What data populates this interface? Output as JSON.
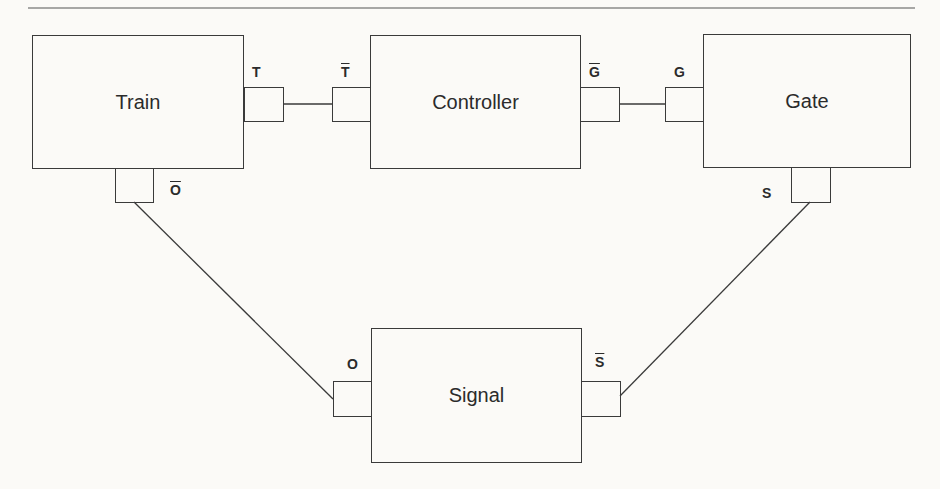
{
  "diagram": {
    "components": [
      {
        "id": "train",
        "label": "Train"
      },
      {
        "id": "controller",
        "label": "Controller"
      },
      {
        "id": "gate",
        "label": "Gate"
      },
      {
        "id": "signal",
        "label": "Signal"
      }
    ],
    "ports": [
      {
        "id": "train-t",
        "label": "T",
        "overbar": false,
        "component": "Train"
      },
      {
        "id": "train-o",
        "label": "O",
        "overbar": true,
        "component": "Train"
      },
      {
        "id": "controller-t",
        "label": "T",
        "overbar": true,
        "component": "Controller"
      },
      {
        "id": "controller-g",
        "label": "G",
        "overbar": true,
        "component": "Controller"
      },
      {
        "id": "gate-g",
        "label": "G",
        "overbar": false,
        "component": "Gate"
      },
      {
        "id": "gate-s",
        "label": "S",
        "overbar": false,
        "component": "Gate"
      },
      {
        "id": "signal-o",
        "label": "O",
        "overbar": false,
        "component": "Signal"
      },
      {
        "id": "signal-s",
        "label": "S",
        "overbar": true,
        "component": "Signal"
      }
    ],
    "connections": [
      {
        "from": "Train.T",
        "to": "Controller.T̄"
      },
      {
        "from": "Controller.Ḡ",
        "to": "Gate.G"
      },
      {
        "from": "Train.Ō",
        "to": "Signal.O"
      },
      {
        "from": "Gate.S",
        "to": "Signal.S̄"
      }
    ],
    "colors": {
      "line": "#3a3a3a",
      "background": "#fbfaf7"
    }
  }
}
